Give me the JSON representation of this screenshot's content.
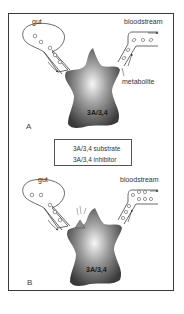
{
  "figure": {
    "panels": [
      {
        "id": "A",
        "label": "A",
        "compartments": {
          "left": "gut",
          "right": "bloodstream"
        },
        "annotation": "metabolite",
        "enzyme": "3A/3,4",
        "description": "Substrate moves from gut through enzyme; converted to metabolite entering bloodstream"
      },
      {
        "id": "B",
        "label": "B",
        "compartments": {
          "left": "gut",
          "right": "bloodstream"
        },
        "enzyme": "3A/3,4",
        "description": "Inhibitor blocks enzyme; unmetabolized substrate accumulates in bloodstream"
      }
    ],
    "legend": {
      "items": [
        {
          "icon": "substrate-icon",
          "label": "3A/3,4 substrate"
        },
        {
          "icon": "inhibitor-icon",
          "label": "3A/3,4 inhibitor"
        }
      ]
    },
    "colors": {
      "frame": "#3a3a3a",
      "enzyme_dark": "#3c3c3c",
      "enzyme_light": "#f4f4f4",
      "inhibitor": "#8a8a8a"
    }
  }
}
